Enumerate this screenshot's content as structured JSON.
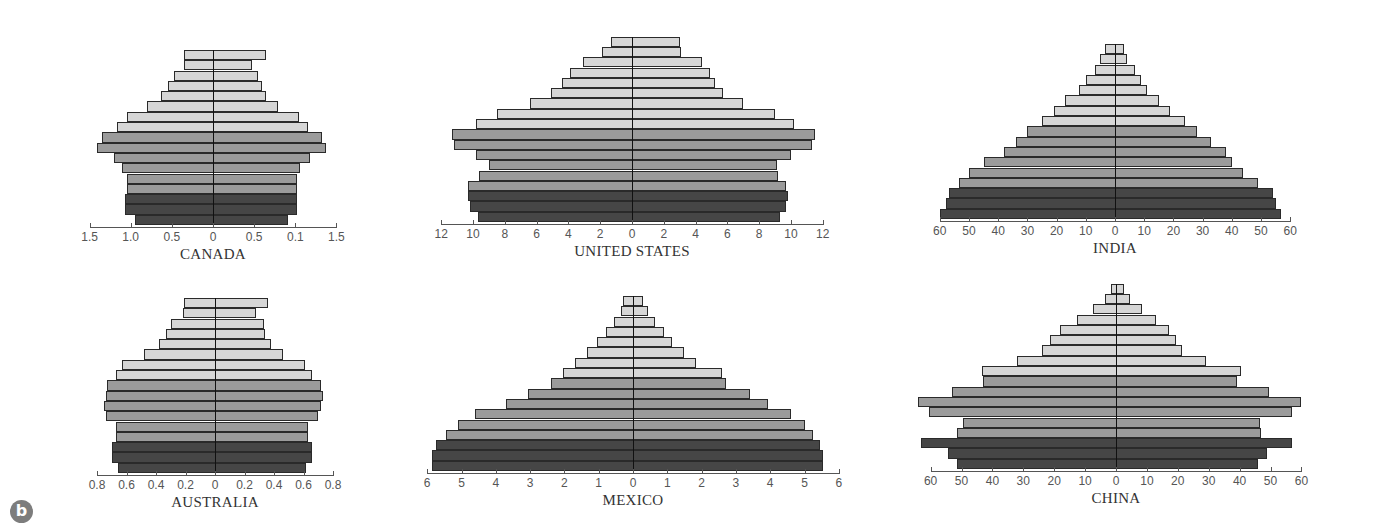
{
  "figure": {
    "panel_label": "b"
  },
  "colors": {
    "light": "#d6d6d6",
    "medium": "#9b9b9b",
    "dark": "#464646"
  },
  "chart_data": [
    {
      "type": "bar",
      "subtype": "population-pyramid",
      "title": "CANADA",
      "orientation": "horizontal",
      "tick_labels_left": [
        "1.5",
        "1.0",
        "0.5",
        "0"
      ],
      "tick_labels_right": [
        "0.5",
        "0.1",
        "1.5"
      ],
      "xlim": [
        -1.5,
        1.5
      ],
      "bar_order": "top-to-bottom",
      "shades": [
        "light",
        "light",
        "light",
        "light",
        "light",
        "light",
        "light",
        "light",
        "medium",
        "medium",
        "medium",
        "medium",
        "medium",
        "medium",
        "dark",
        "dark",
        "dark"
      ],
      "left_values": [
        0.35,
        0.35,
        0.47,
        0.55,
        0.63,
        0.8,
        1.05,
        1.17,
        1.35,
        1.41,
        1.2,
        1.1,
        1.05,
        1.05,
        1.07,
        1.07,
        0.95
      ],
      "right_values": [
        0.64,
        0.47,
        0.55,
        0.59,
        0.64,
        0.79,
        1.04,
        1.16,
        1.32,
        1.37,
        1.18,
        1.06,
        1.02,
        1.02,
        1.02,
        1.02,
        0.91
      ]
    },
    {
      "type": "bar",
      "subtype": "population-pyramid",
      "title": "UNITED STATES",
      "orientation": "horizontal",
      "tick_labels_left": [
        "12",
        "10",
        "8",
        "6",
        "4",
        "2",
        "0"
      ],
      "tick_labels_right": [
        "2",
        "4",
        "6",
        "8",
        "10",
        "12"
      ],
      "xlim": [
        -12,
        12
      ],
      "bar_order": "top-to-bottom",
      "shades": [
        "light",
        "light",
        "light",
        "light",
        "light",
        "light",
        "light",
        "light",
        "light",
        "medium",
        "medium",
        "medium",
        "medium",
        "medium",
        "medium",
        "dark",
        "dark",
        "dark"
      ],
      "left_values": [
        1.3,
        1.9,
        3.1,
        3.9,
        4.4,
        5.1,
        6.4,
        8.5,
        9.8,
        11.3,
        11.2,
        9.8,
        9.0,
        9.6,
        10.3,
        10.3,
        10.2,
        9.7
      ],
      "right_values": [
        3.0,
        3.1,
        4.4,
        4.9,
        5.2,
        5.7,
        7.0,
        9.0,
        10.2,
        11.5,
        11.3,
        10.0,
        9.1,
        9.2,
        9.7,
        9.8,
        9.7,
        9.3
      ]
    },
    {
      "type": "bar",
      "subtype": "population-pyramid",
      "title": "INDIA",
      "orientation": "horizontal",
      "tick_labels_left": [
        "60",
        "50",
        "40",
        "30",
        "20",
        "10",
        "0"
      ],
      "tick_labels_right": [
        "10",
        "20",
        "30",
        "40",
        "50",
        "60"
      ],
      "xlim": [
        -60,
        60
      ],
      "bar_order": "top-to-bottom",
      "shades": [
        "light",
        "light",
        "light",
        "light",
        "light",
        "light",
        "light",
        "light",
        "medium",
        "medium",
        "medium",
        "medium",
        "medium",
        "medium",
        "dark",
        "dark",
        "dark"
      ],
      "left_values": [
        3.5,
        5,
        7,
        10,
        12.5,
        17,
        21,
        25,
        30,
        34,
        38,
        45,
        50,
        53.5,
        57,
        58,
        60
      ],
      "right_values": [
        3,
        4,
        7,
        9,
        11,
        15,
        19,
        24,
        28,
        33,
        38,
        40,
        44,
        49,
        54,
        55,
        57
      ]
    },
    {
      "type": "bar",
      "subtype": "population-pyramid",
      "title": "AUSTRALIA",
      "orientation": "horizontal",
      "tick_labels_left": [
        "0.8",
        "0.6",
        "0.4",
        "0.2",
        "0"
      ],
      "tick_labels_right": [
        "0.2",
        "0.4",
        "0.6",
        "0.8"
      ],
      "xlim": [
        -0.8,
        0.8
      ],
      "bar_order": "top-to-bottom",
      "shades": [
        "light",
        "light",
        "light",
        "light",
        "light",
        "light",
        "light",
        "light",
        "medium",
        "medium",
        "medium",
        "medium",
        "medium",
        "medium",
        "dark",
        "dark",
        "dark"
      ],
      "left_values": [
        0.21,
        0.22,
        0.3,
        0.33,
        0.38,
        0.48,
        0.63,
        0.67,
        0.73,
        0.74,
        0.75,
        0.74,
        0.67,
        0.67,
        0.7,
        0.7,
        0.66
      ],
      "right_values": [
        0.36,
        0.28,
        0.33,
        0.34,
        0.38,
        0.46,
        0.61,
        0.66,
        0.72,
        0.73,
        0.72,
        0.7,
        0.63,
        0.63,
        0.66,
        0.66,
        0.62
      ]
    },
    {
      "type": "bar",
      "subtype": "population-pyramid",
      "title": "MEXICO",
      "orientation": "horizontal",
      "tick_labels_left": [
        "6",
        "5",
        "4",
        "3",
        "2",
        "1",
        "0"
      ],
      "tick_labels_right": [
        "1",
        "2",
        "3",
        "4",
        "5",
        "6"
      ],
      "xlim": [
        -6,
        6
      ],
      "bar_order": "top-to-bottom",
      "shades": [
        "light",
        "light",
        "light",
        "light",
        "light",
        "light",
        "light",
        "light",
        "medium",
        "medium",
        "medium",
        "medium",
        "medium",
        "medium",
        "dark",
        "dark",
        "dark"
      ],
      "left_values": [
        0.3,
        0.35,
        0.55,
        0.8,
        1.05,
        1.35,
        1.7,
        2.05,
        2.4,
        3.05,
        3.7,
        4.6,
        5.1,
        5.45,
        5.75,
        5.85,
        5.85
      ],
      "right_values": [
        0.3,
        0.45,
        0.65,
        0.9,
        1.15,
        1.5,
        1.85,
        2.6,
        2.7,
        3.4,
        3.95,
        4.6,
        5.0,
        5.25,
        5.45,
        5.55,
        5.55
      ]
    },
    {
      "type": "bar",
      "subtype": "population-pyramid",
      "title": "CHINA",
      "orientation": "horizontal",
      "tick_labels_left": [
        "60",
        "50",
        "40",
        "30",
        "20",
        "10",
        "0"
      ],
      "tick_labels_right": [
        "10",
        "20",
        "30",
        "40",
        "50",
        "60"
      ],
      "xlim": [
        -60,
        60
      ],
      "bar_order": "top-to-bottom",
      "shades": [
        "light",
        "light",
        "light",
        "light",
        "light",
        "light",
        "light",
        "light",
        "light",
        "medium",
        "medium",
        "medium",
        "medium",
        "medium",
        "medium",
        "dark",
        "dark",
        "dark"
      ],
      "left_values": [
        1.5,
        3.5,
        7.5,
        12.5,
        18,
        21.5,
        24,
        32,
        43.5,
        43,
        53,
        64,
        60.5,
        49.5,
        51.5,
        63,
        54.5,
        51.5
      ],
      "right_values": [
        2.5,
        4.5,
        8.5,
        13,
        17,
        19.5,
        21.5,
        29,
        40.5,
        39,
        49.5,
        60,
        57,
        46.5,
        47,
        57,
        49,
        46
      ]
    }
  ]
}
